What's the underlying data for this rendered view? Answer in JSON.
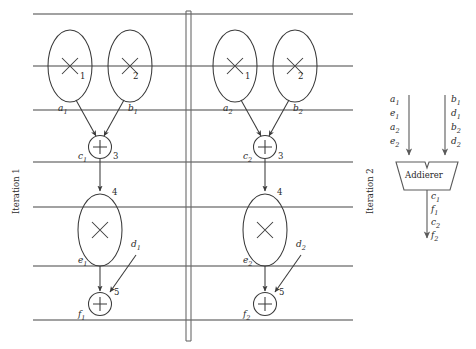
{
  "diagram": {
    "stroke_color": "#3a3a3a",
    "grid_line_color": "#444444",
    "iterations": [
      {
        "name": "iteration-1",
        "label": "Iteration 1",
        "nodes": [
          {
            "id": "n1",
            "shape": "ellipse",
            "op": "multiply",
            "glyph": "×",
            "number": "1"
          },
          {
            "id": "n2",
            "shape": "ellipse",
            "op": "multiply",
            "glyph": "×",
            "number": "2"
          },
          {
            "id": "n3",
            "shape": "circle",
            "op": "add",
            "glyph": "+",
            "number": "3"
          },
          {
            "id": "n4",
            "shape": "ellipse",
            "op": "multiply",
            "glyph": "×",
            "number": "4"
          },
          {
            "id": "n5",
            "shape": "circle",
            "op": "add",
            "glyph": "+",
            "number": "5"
          }
        ],
        "edges": [
          {
            "name": "a1",
            "base": "a",
            "sub": "1"
          },
          {
            "name": "b1",
            "base": "b",
            "sub": "1"
          },
          {
            "name": "c1",
            "base": "c",
            "sub": "1"
          },
          {
            "name": "d1",
            "base": "d",
            "sub": "1"
          },
          {
            "name": "e1",
            "base": "e",
            "sub": "1"
          },
          {
            "name": "f1",
            "base": "f",
            "sub": "1"
          }
        ]
      },
      {
        "name": "iteration-2",
        "label": "Iteration 2",
        "nodes": [
          {
            "id": "m1",
            "shape": "ellipse",
            "op": "multiply",
            "glyph": "×",
            "number": "1"
          },
          {
            "id": "m2",
            "shape": "ellipse",
            "op": "multiply",
            "glyph": "×",
            "number": "2"
          },
          {
            "id": "m3",
            "shape": "circle",
            "op": "add",
            "glyph": "+",
            "number": "3"
          },
          {
            "id": "m4",
            "shape": "ellipse",
            "op": "multiply",
            "glyph": "×",
            "number": "4"
          },
          {
            "id": "m5",
            "shape": "circle",
            "op": "add",
            "glyph": "+",
            "number": "5"
          }
        ],
        "edges": [
          {
            "name": "a2",
            "base": "a",
            "sub": "2"
          },
          {
            "name": "b2",
            "base": "b",
            "sub": "2"
          },
          {
            "name": "c2",
            "base": "c",
            "sub": "2"
          },
          {
            "name": "d2",
            "base": "d",
            "sub": "2"
          },
          {
            "name": "e2",
            "base": "e",
            "sub": "2"
          },
          {
            "name": "f2",
            "base": "f",
            "sub": "2"
          }
        ]
      }
    ],
    "functional_unit": {
      "name": "adder-unit",
      "label": "Addierer",
      "left_inputs": [
        {
          "base": "a",
          "sub": "1"
        },
        {
          "base": "e",
          "sub": "1"
        },
        {
          "base": "a",
          "sub": "2"
        },
        {
          "base": "e",
          "sub": "2"
        }
      ],
      "right_inputs": [
        {
          "base": "b",
          "sub": "1"
        },
        {
          "base": "d",
          "sub": "1"
        },
        {
          "base": "b",
          "sub": "2"
        },
        {
          "base": "d",
          "sub": "2"
        }
      ],
      "outputs": [
        {
          "base": "c",
          "sub": "1"
        },
        {
          "base": "f",
          "sub": "1"
        },
        {
          "base": "c",
          "sub": "2"
        },
        {
          "base": "f",
          "sub": "2"
        }
      ]
    }
  }
}
